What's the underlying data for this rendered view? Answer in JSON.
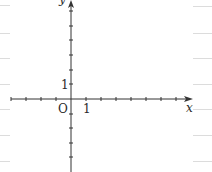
{
  "diagram": {
    "type": "coordinate-plane",
    "x_axis_label": "x",
    "y_axis_label": "y",
    "origin_label": "O",
    "x_unit_label": "1",
    "y_unit_label": "1",
    "x_ticks_negative": 4,
    "x_ticks_positive": 7,
    "y_ticks_positive": 6,
    "y_ticks_negative": 4,
    "axis_color": "#333333",
    "rule_line_color": "#d8d8d8"
  }
}
